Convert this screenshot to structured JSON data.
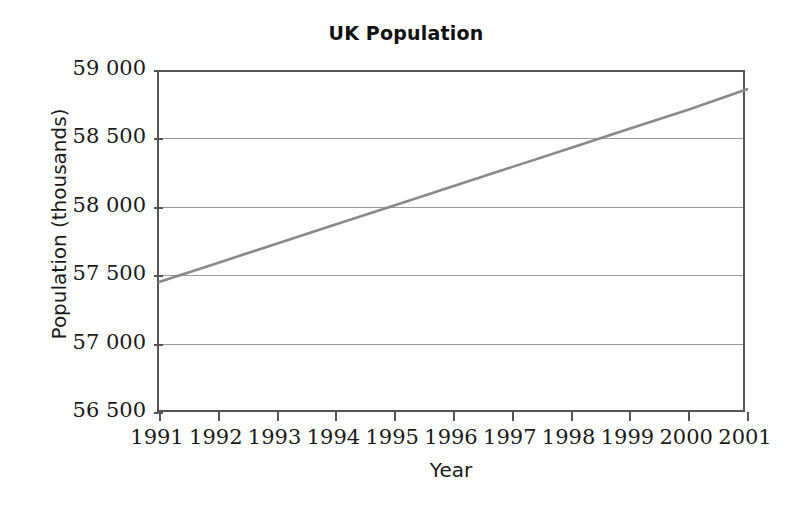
{
  "chart_data": {
    "type": "line",
    "title": "UK Population",
    "xlabel": "Year",
    "ylabel": "Population (thousands)",
    "x": [
      1991,
      1992,
      1993,
      1994,
      1995,
      1996,
      1997,
      1998,
      1999,
      2000,
      2001
    ],
    "series": [
      {
        "name": "UK Population",
        "color": "#8a8a8a",
        "values": [
          57450,
          57590,
          57730,
          57870,
          58010,
          58150,
          58290,
          58430,
          58570,
          58710,
          58860
        ]
      }
    ],
    "xlim": [
      1991,
      2001
    ],
    "ylim": [
      56500,
      59000
    ],
    "xticks": [
      "1991",
      "1992",
      "1993",
      "1994",
      "1995",
      "1996",
      "1997",
      "1998",
      "1999",
      "2000",
      "2001"
    ],
    "yticks": [
      "56 500",
      "57 000",
      "57 500",
      "58 000",
      "58 500",
      "59 000"
    ],
    "ytick_values": [
      56500,
      57000,
      57500,
      58000,
      58500,
      59000
    ],
    "grid": "horizontal",
    "legend": "none",
    "annotations": [
      "Line crosses 58 000 thousand between 1995 and 1996",
      "Line crosses 58 500 thousand just after 1999"
    ],
    "gridline_color": "#9a9a9a",
    "axis_color": "#555555",
    "background_color": "#ffffff"
  }
}
